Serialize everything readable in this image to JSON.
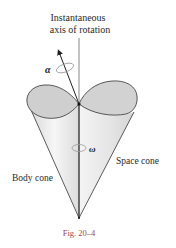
{
  "figure": {
    "title_line1": "Instantaneous",
    "title_line2": "axis of rotation",
    "alpha_symbol": "α",
    "omega_symbol": "ω",
    "space_cone_label": "Space cone",
    "body_cone_label": "Body cone",
    "caption": "Fig. 20–4"
  },
  "colors": {
    "cone_fill": "#e6e6e6",
    "cone_top_fill": "#cfcfcf",
    "stroke": "#333333",
    "caption": "#9a4a4a"
  }
}
